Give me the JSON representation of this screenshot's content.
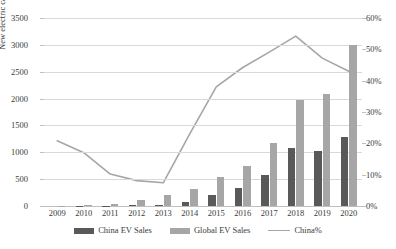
{
  "chart_data": {
    "type": "bar",
    "title": "",
    "xlabel": "",
    "ylabel": "New electric car sales (000)",
    "y2label": "",
    "categories": [
      "2009",
      "2010",
      "2011",
      "2012",
      "2013",
      "2014",
      "2015",
      "2016",
      "2017",
      "2018",
      "2019",
      "2020"
    ],
    "ylim": [
      0,
      3500
    ],
    "y2lim": [
      0,
      60
    ],
    "grid": true,
    "legend_position": "bottom",
    "yticks": [
      "0",
      "500",
      "1000",
      "1500",
      "2000",
      "2500",
      "3000",
      "3500"
    ],
    "ytick_values": [
      0,
      500,
      1000,
      1500,
      2000,
      2500,
      3000,
      3500
    ],
    "y2ticks": [
      "0%",
      "10%",
      "20%",
      "30%",
      "40%",
      "50%",
      "60%"
    ],
    "y2tick_values": [
      0,
      10,
      20,
      30,
      40,
      50,
      60
    ],
    "series": [
      {
        "name": "China EV Sales",
        "type": "bar",
        "axis": "left",
        "color": "#595959",
        "values": [
          1,
          2,
          8,
          13,
          18,
          75,
          207,
          336,
          579,
          1082,
          1020,
          1294
        ]
      },
      {
        "name": "Global EV Sales",
        "type": "bar",
        "axis": "left",
        "color": "#a6a6a6",
        "values": [
          5,
          12,
          45,
          118,
          200,
          325,
          546,
          750,
          1174,
          1972,
          2090,
          3000
        ]
      },
      {
        "name": "China%",
        "type": "line",
        "axis": "right",
        "color": "#a6a6a6",
        "values": [
          20.8,
          17.0,
          10.2,
          8.1,
          7.4,
          23.0,
          38.0,
          44.2,
          49.1,
          54.2,
          47.2,
          43.0
        ]
      }
    ]
  },
  "legend": {
    "items": [
      {
        "label": "China EV Sales",
        "marker": "bar-swatch-dark"
      },
      {
        "label": "Global EV Sales",
        "marker": "bar-swatch-gray"
      },
      {
        "label": "China%",
        "marker": "line-swatch-gray"
      }
    ]
  }
}
